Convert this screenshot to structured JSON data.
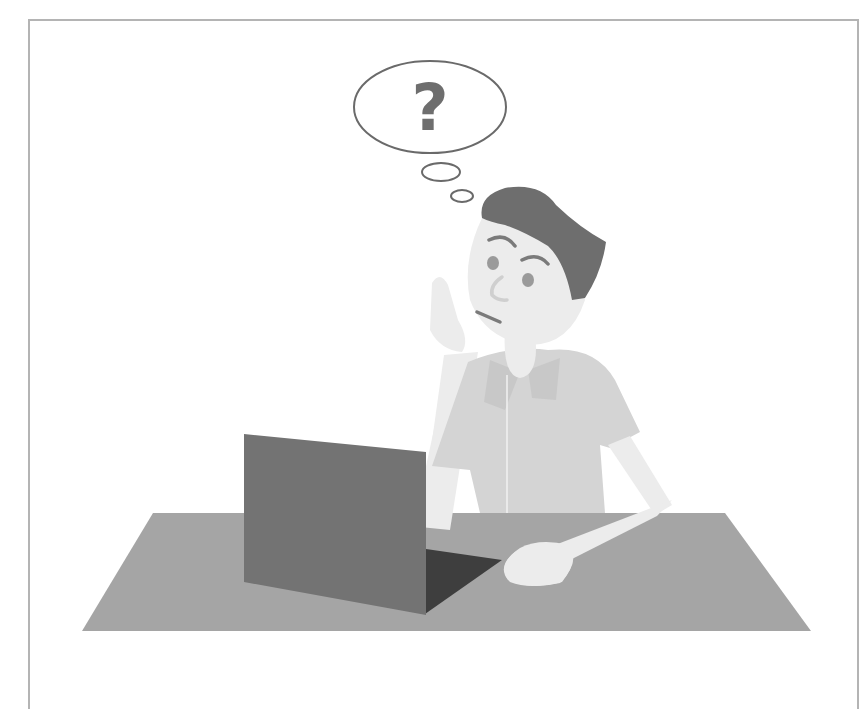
{
  "illustration": {
    "subject": "confused man sitting at a laptop",
    "thought_bubble": {
      "symbol": "?"
    },
    "colors": {
      "frame_border": "#b4b4b4",
      "table": "#a5a5a5",
      "laptop_screen_back": "#737373",
      "laptop_keyboard": "#3e3e3e",
      "hair": "#6e6e6e",
      "skin": "#ececec",
      "shirt": "#d4d4d4",
      "shirt_shade": "#c8c8c8",
      "bubble_outline": "#6a6a6a",
      "question_mark": "#6e6e6e",
      "facial_features": "#7a7a7a"
    }
  }
}
